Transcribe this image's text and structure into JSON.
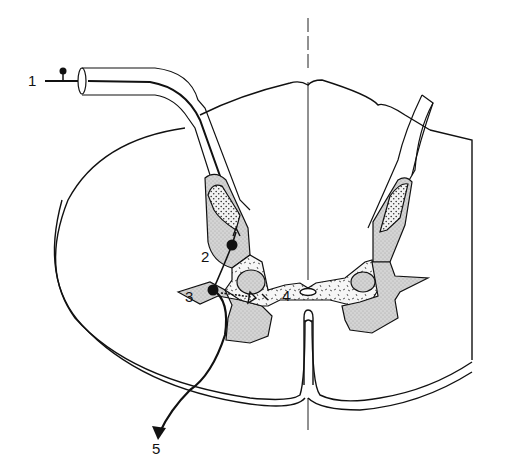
{
  "diagram": {
    "type": "spinal-cord-cross-section",
    "labels": [
      {
        "id": "1",
        "text": "1",
        "x": 28,
        "y": 86
      },
      {
        "id": "2",
        "text": "2",
        "x": 201,
        "y": 262
      },
      {
        "id": "3",
        "text": "3",
        "x": 185,
        "y": 302
      },
      {
        "id": "4",
        "text": "4",
        "x": 282,
        "y": 301
      },
      {
        "id": "5",
        "text": "5",
        "x": 152,
        "y": 454
      }
    ],
    "colors": {
      "stroke": "#111111",
      "gray_matter_fill": "#cfcfcf",
      "stipple_fill": "#e6e6e6",
      "background": "#ffffff"
    }
  }
}
